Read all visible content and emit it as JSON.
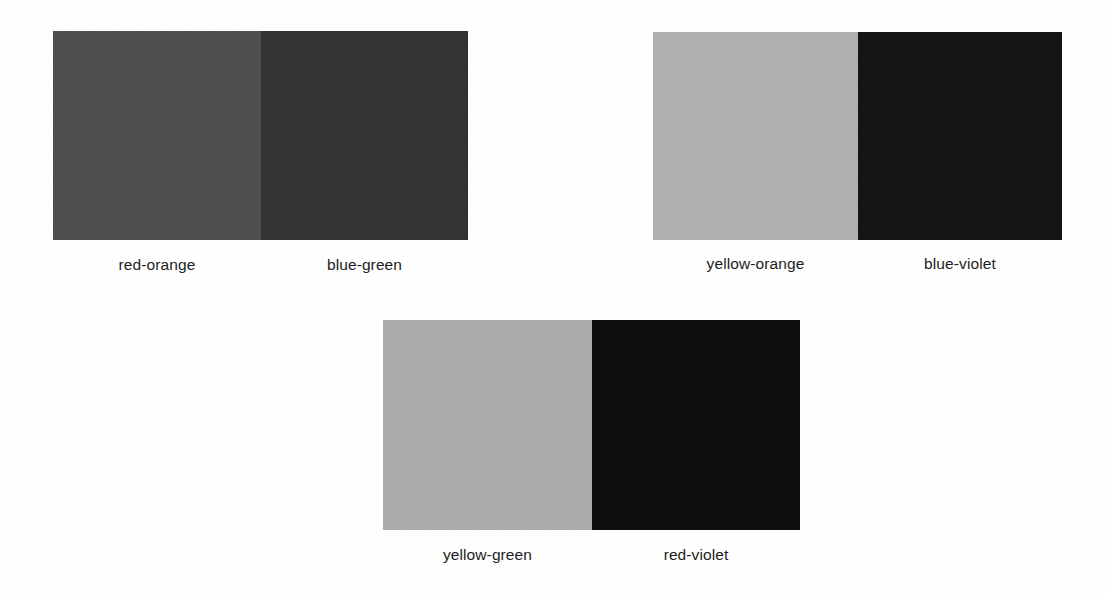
{
  "plate": {
    "background_color": "#fefefe",
    "label_text_color": "#1d1d1d",
    "pairs": [
      {
        "name": "pair-red-orange-blue-green",
        "position": {
          "left": 53,
          "top": 31,
          "width": 415,
          "height": 209
        },
        "divider_x": 208,
        "label_row_top": 255,
        "swatches": [
          {
            "label": "red-orange",
            "color": "#4a4a4a",
            "width": 208
          },
          {
            "label": "blue-green",
            "color": "#2e2e2e",
            "width": 207
          }
        ]
      },
      {
        "name": "pair-yellow-orange-blue-violet",
        "position": {
          "left": 653,
          "top": 32,
          "width": 409,
          "height": 208
        },
        "divider_x": 205,
        "label_row_top": 254,
        "swatches": [
          {
            "label": "yellow-orange",
            "color": "#b0b0b0",
            "width": 205
          },
          {
            "label": "blue-violet",
            "color": "#0d0d0d",
            "width": 204
          }
        ]
      },
      {
        "name": "pair-yellow-green-red-violet",
        "position": {
          "left": 383,
          "top": 320,
          "width": 417,
          "height": 210
        },
        "divider_x": 209,
        "label_row_top": 545,
        "swatches": [
          {
            "label": "yellow-green",
            "color": "#ababab",
            "width": 209
          },
          {
            "label": "red-violet",
            "color": "#060606",
            "width": 208
          }
        ]
      }
    ]
  }
}
